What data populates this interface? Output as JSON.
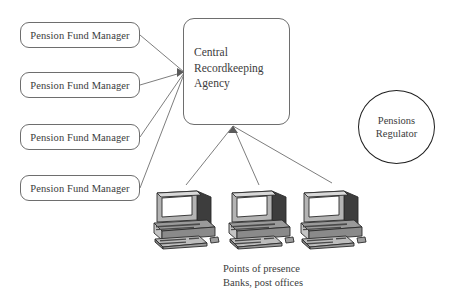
{
  "diagram": {
    "title_text": "",
    "background_color": "#ffffff",
    "line_color": "#6e6e6e",
    "text_color": "#3c3c3c",
    "regulator_stroke_color": "#1f1f1f"
  },
  "pension_fund_managers": [
    {
      "label": "Pension Fund Manager"
    },
    {
      "label": "Pension Fund Manager"
    },
    {
      "label": "Pension Fund Manager"
    },
    {
      "label": "Pension Fund Manager"
    }
  ],
  "central_agency": {
    "line1": "Central",
    "line2": "Recordkeeping",
    "line3": "Agency"
  },
  "regulator": {
    "line1": "Pensions",
    "line2": "Regulator"
  },
  "points_of_presence": {
    "caption_line1": "Points of presence",
    "caption_line2": "Banks, post offices",
    "terminals": [
      {
        "icon": "desktop-computer-icon"
      },
      {
        "icon": "desktop-computer-icon"
      },
      {
        "icon": "desktop-computer-icon"
      }
    ]
  }
}
